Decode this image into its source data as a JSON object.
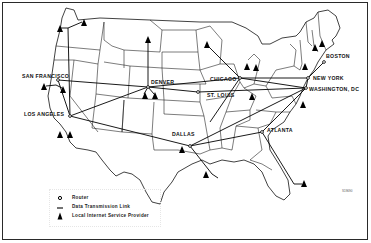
{
  "map": {
    "title": "",
    "region": "Continental United States",
    "cities": [
      {
        "name": "SAN FRANCISCO"
      },
      {
        "name": "DENVER"
      },
      {
        "name": "LOS ANGELES"
      },
      {
        "name": "CHICAGO"
      },
      {
        "name": "ST. LOUIS"
      },
      {
        "name": "DALLAS"
      },
      {
        "name": "ATLANTA"
      },
      {
        "name": "NEW YORK"
      },
      {
        "name": "WASHINGTON, DC"
      },
      {
        "name": "BOSTON"
      }
    ],
    "code": "S19690"
  },
  "legend": {
    "items": [
      {
        "icon": "router-icon",
        "label": "Router"
      },
      {
        "icon": "link-line-icon",
        "label": "Data Transmission Link"
      },
      {
        "icon": "isp-triangle-icon",
        "label": "Local Internet Service Provider"
      }
    ]
  },
  "colors": {
    "ink": "#111111",
    "background": "#ffffff"
  }
}
